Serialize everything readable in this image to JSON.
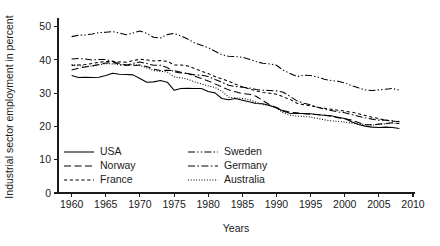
{
  "chart_data": {
    "type": "line",
    "title": "",
    "xlabel": "Years",
    "ylabel": "Industrial sector employment in percent",
    "xlim": [
      1958,
      2010
    ],
    "ylim": [
      0,
      52
    ],
    "xticks": [
      1960,
      1965,
      1970,
      1975,
      1980,
      1985,
      1990,
      1995,
      2000,
      2005,
      2010
    ],
    "yticks": [
      0,
      10,
      20,
      30,
      40,
      50
    ],
    "grid": false,
    "legend_position": "inside-bottom-left",
    "x": [
      1960,
      1961,
      1962,
      1963,
      1964,
      1965,
      1966,
      1967,
      1968,
      1969,
      1970,
      1971,
      1972,
      1973,
      1974,
      1975,
      1976,
      1977,
      1978,
      1979,
      1980,
      1981,
      1982,
      1983,
      1984,
      1985,
      1986,
      1987,
      1988,
      1989,
      1990,
      1991,
      1992,
      1993,
      1994,
      1995,
      1996,
      1997,
      1998,
      1999,
      2000,
      2001,
      2002,
      2003,
      2004,
      2005,
      2006,
      2007,
      2008
    ],
    "series": [
      {
        "name": "USA",
        "dash": "solid",
        "values": [
          35.3,
          34.7,
          34.8,
          34.7,
          34.8,
          35.3,
          36.0,
          35.7,
          35.6,
          35.5,
          34.4,
          33.3,
          33.4,
          33.8,
          33.3,
          30.9,
          31.4,
          31.5,
          31.4,
          31.4,
          30.5,
          30.1,
          28.4,
          28.0,
          28.4,
          27.9,
          27.4,
          26.9,
          26.8,
          26.3,
          25.6,
          24.6,
          24.0,
          23.9,
          23.9,
          23.8,
          23.5,
          23.4,
          23.2,
          22.8,
          22.4,
          21.4,
          20.6,
          20.1,
          19.8,
          19.7,
          19.8,
          19.7,
          19.4
        ]
      },
      {
        "name": "Norway",
        "dash": "dashed",
        "values": [
          37.0,
          37.5,
          37.9,
          38.2,
          38.6,
          39.1,
          39.2,
          39.0,
          38.5,
          38.3,
          38.5,
          38.0,
          37.2,
          36.8,
          36.9,
          36.8,
          36.3,
          35.9,
          35.1,
          34.4,
          33.7,
          32.8,
          31.9,
          31.0,
          30.4,
          29.9,
          29.7,
          29.1,
          27.8,
          26.5,
          25.7,
          24.8,
          24.3,
          24.1,
          23.8,
          23.7,
          23.6,
          23.4,
          23.1,
          22.6,
          22.3,
          21.9,
          21.2,
          20.5,
          20.5,
          20.7,
          20.9,
          21.1,
          20.9
        ]
      },
      {
        "name": "France",
        "dash": "smalldash",
        "values": [
          38.3,
          38.5,
          38.6,
          38.9,
          39.3,
          39.5,
          39.6,
          39.4,
          39.3,
          39.8,
          40.2,
          40.0,
          39.7,
          39.8,
          39.6,
          38.5,
          38.5,
          38.2,
          37.4,
          36.6,
          35.9,
          35.0,
          34.3,
          33.6,
          32.7,
          31.9,
          31.3,
          30.7,
          30.2,
          30.0,
          29.7,
          28.9,
          28.1,
          27.0,
          26.5,
          26.2,
          25.8,
          25.5,
          25.2,
          24.9,
          24.6,
          24.3,
          23.8,
          23.3,
          22.8,
          22.3,
          21.9,
          21.6,
          21.5
        ]
      },
      {
        "name": "Sweden",
        "dash": "dashdotdot",
        "values": [
          47.0,
          47.4,
          47.5,
          47.8,
          48.2,
          48.3,
          48.5,
          48.1,
          47.6,
          48.1,
          48.7,
          48.0,
          46.8,
          46.6,
          47.6,
          48.0,
          47.2,
          46.3,
          45.1,
          44.4,
          43.7,
          42.6,
          41.6,
          41.1,
          41.0,
          40.8,
          40.2,
          39.5,
          39.0,
          38.8,
          38.4,
          36.9,
          35.9,
          35.0,
          35.4,
          35.3,
          34.9,
          34.2,
          33.8,
          33.6,
          33.1,
          32.3,
          31.6,
          31.0,
          30.8,
          31.0,
          31.2,
          31.4,
          30.9
        ]
      },
      {
        "name": "Germany",
        "dash": "dashdot",
        "values": [
          40.3,
          40.4,
          40.3,
          40.0,
          40.1,
          40.1,
          39.6,
          38.5,
          38.4,
          39.0,
          39.4,
          38.9,
          38.4,
          38.4,
          37.7,
          36.4,
          36.1,
          35.9,
          35.5,
          35.4,
          35.0,
          34.1,
          33.3,
          32.4,
          32.0,
          31.8,
          31.6,
          31.1,
          30.9,
          30.8,
          30.7,
          30.3,
          29.0,
          27.7,
          27.0,
          26.5,
          25.8,
          25.2,
          24.8,
          24.4,
          24.1,
          23.6,
          23.1,
          22.6,
          22.2,
          21.9,
          21.9,
          21.7,
          21.4
        ]
      },
      {
        "name": "Australia",
        "dash": "dotted",
        "values": [
          38.6,
          38.4,
          38.0,
          38.2,
          38.5,
          38.9,
          38.8,
          38.6,
          38.5,
          38.6,
          38.3,
          37.6,
          36.8,
          36.6,
          36.4,
          34.9,
          34.6,
          34.2,
          33.4,
          32.8,
          32.2,
          31.7,
          30.6,
          28.8,
          28.6,
          28.4,
          28.1,
          27.3,
          26.6,
          26.3,
          25.5,
          24.1,
          23.4,
          23.1,
          23.0,
          22.8,
          22.4,
          22.0,
          21.7,
          21.5,
          21.3,
          21.0,
          20.7,
          20.6,
          20.4,
          20.6,
          20.8,
          21.0,
          20.9
        ]
      }
    ]
  },
  "legend": {
    "entries": [
      {
        "label": "USA",
        "dash": "solid"
      },
      {
        "label": "Norway",
        "dash": "dashed"
      },
      {
        "label": "France",
        "dash": "smalldash"
      },
      {
        "label": "Sweden",
        "dash": "dashdotdot"
      },
      {
        "label": "Germany",
        "dash": "dashdot"
      },
      {
        "label": "Australia",
        "dash": "dotted"
      }
    ]
  },
  "colors": {
    "ink": "#1a1a1a",
    "line": "#000000",
    "background": "#ffffff"
  }
}
